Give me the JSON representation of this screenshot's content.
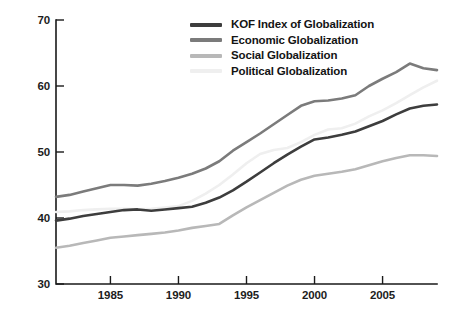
{
  "chart_data": {
    "type": "line",
    "title": "",
    "subtitle": "",
    "xlabel": "",
    "ylabel": "",
    "xlim": [
      1981,
      2009
    ],
    "ylim": [
      30,
      70
    ],
    "grid": false,
    "legend_position": "top-center",
    "y_ticks": [
      "70",
      "60",
      "50",
      "40",
      "30"
    ],
    "y_tick_values": [
      70,
      60,
      50,
      40,
      30
    ],
    "x_ticks": [
      "1985",
      "1990",
      "1995",
      "2000",
      "2005"
    ],
    "x_tick_values": [
      1985,
      1990,
      1995,
      2000,
      2005
    ],
    "x": [
      1981,
      1982,
      1983,
      1984,
      1985,
      1986,
      1987,
      1988,
      1989,
      1990,
      1991,
      1992,
      1993,
      1994,
      1995,
      1996,
      1997,
      1998,
      1999,
      2000,
      2001,
      2002,
      2003,
      2004,
      2005,
      2006,
      2007,
      2008,
      2009
    ],
    "series": [
      {
        "name": "KOF Index of Globalization",
        "color": "#3d3d3d",
        "values": [
          39.6,
          39.9,
          40.3,
          40.6,
          40.9,
          41.2,
          41.3,
          41.1,
          41.3,
          41.5,
          41.7,
          42.3,
          43.1,
          44.2,
          45.5,
          46.9,
          48.3,
          49.6,
          50.8,
          51.9,
          52.2,
          52.6,
          53.1,
          53.9,
          54.7,
          55.7,
          56.6,
          57.0,
          57.2
        ]
      },
      {
        "name": "Economic Globalization",
        "color": "#7b7b7b",
        "values": [
          43.2,
          43.5,
          44.0,
          44.5,
          45.0,
          45.0,
          44.9,
          45.2,
          45.6,
          46.1,
          46.7,
          47.5,
          48.6,
          50.2,
          51.5,
          52.8,
          54.2,
          55.6,
          57.0,
          57.7,
          57.8,
          58.1,
          58.6,
          60.0,
          61.1,
          62.1,
          63.4,
          62.7,
          62.4
        ]
      },
      {
        "name": "Social Globalization",
        "color": "#b8b8b8",
        "values": [
          35.5,
          35.8,
          36.2,
          36.6,
          37.0,
          37.2,
          37.4,
          37.6,
          37.8,
          38.1,
          38.5,
          38.8,
          39.1,
          40.4,
          41.6,
          42.7,
          43.8,
          44.9,
          45.8,
          46.4,
          46.7,
          47.0,
          47.4,
          48.0,
          48.6,
          49.1,
          49.5,
          49.5,
          49.4
        ]
      },
      {
        "name": "Political Globalization",
        "color": "#efefef",
        "values": [
          40.9,
          41.0,
          41.2,
          41.3,
          41.4,
          41.4,
          41.3,
          41.4,
          41.6,
          41.8,
          42.6,
          43.7,
          45.0,
          46.6,
          48.3,
          49.7,
          50.3,
          50.6,
          51.5,
          52.6,
          53.4,
          53.6,
          54.3,
          55.4,
          56.3,
          57.4,
          58.6,
          59.8,
          60.8
        ]
      }
    ],
    "legend": [
      {
        "label": "KOF Index of Globalization",
        "color": "#3d3d3d"
      },
      {
        "label": "Economic Globalization",
        "color": "#7b7b7b"
      },
      {
        "label": "Social Globalization",
        "color": "#b8b8b8"
      },
      {
        "label": "Political Globalization",
        "color": "#efefef"
      }
    ],
    "axis_color": "#1a1a1a"
  }
}
